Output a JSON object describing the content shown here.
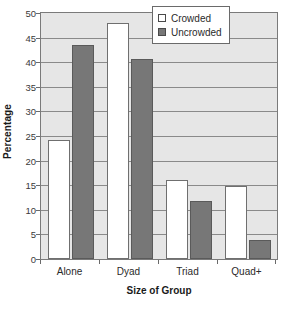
{
  "chart_data": {
    "type": "bar",
    "title": "",
    "xlabel": "Size of Group",
    "ylabel": "Percentage",
    "categories": [
      "Alone",
      "Dyad",
      "Triad",
      "Quad+"
    ],
    "series": [
      {
        "name": "Crowded",
        "values": [
          24.1,
          48.0,
          16.0,
          14.9
        ],
        "color": "#ffffff"
      },
      {
        "name": "Uncrowded",
        "values": [
          43.5,
          40.7,
          11.7,
          3.9
        ],
        "color": "#777777"
      }
    ],
    "ylim": [
      0,
      50
    ],
    "yticks": [
      0,
      5,
      10,
      15,
      20,
      25,
      30,
      35,
      40,
      45,
      50
    ],
    "ytick_labels": [
      "0",
      "5",
      "10",
      "15",
      "20",
      "25",
      "30",
      "35",
      "40",
      "45",
      "50"
    ],
    "grid": true,
    "grid_axis": "y",
    "legend_position": "top-right",
    "legend_entries": [
      "Crowded",
      "Uncrowded"
    ],
    "note_clipped_bars": "Crowded/Dyad bar extends beyond the top of the plot area and is partly hidden behind the legend box",
    "plot_background": "#e6e6e6",
    "frame_color": "#7a7a7a"
  }
}
